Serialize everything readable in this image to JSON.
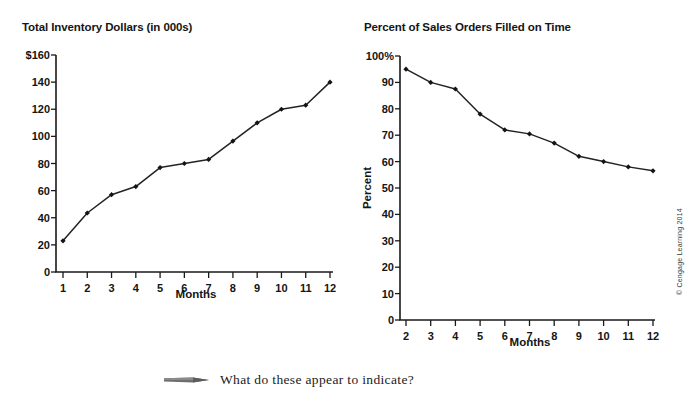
{
  "caption": {
    "icon": "pencil-icon",
    "text": "What do these appear to indicate?"
  },
  "credit": "© Cengage Learning 2014",
  "chart_data": [
    {
      "id": "inventory",
      "type": "line",
      "title": "Total Inventory Dollars (in 000s)",
      "xlabel": "Months",
      "ylabel": "",
      "x": [
        1,
        2,
        3,
        4,
        5,
        6,
        7,
        8,
        9,
        10,
        11,
        12
      ],
      "values": [
        23,
        43.5,
        57,
        63,
        77,
        80,
        83,
        96.5,
        110,
        120,
        123,
        140
      ],
      "categories": [
        "1",
        "2",
        "3",
        "4",
        "5",
        "6",
        "7",
        "8",
        "9",
        "10",
        "11",
        "12"
      ],
      "xtick_labels": [
        "1",
        "2",
        "3",
        "4",
        "5",
        "6",
        "7",
        "8",
        "9",
        "10",
        "11",
        "12"
      ],
      "ytick_values": [
        0,
        20,
        40,
        60,
        80,
        100,
        120,
        140,
        160
      ],
      "ytick_labels": [
        "0",
        "20",
        "40",
        "60",
        "80",
        "100",
        "120",
        "140",
        "$160"
      ],
      "xlim": [
        1,
        12
      ],
      "ylim": [
        0,
        160
      ],
      "grid": false,
      "legend": false,
      "marker": "diamond",
      "line_color": "#232323"
    },
    {
      "id": "on-time",
      "type": "line",
      "title": "Percent of Sales Orders Filled on Time",
      "xlabel": "Months",
      "ylabel": "Percent",
      "x": [
        2,
        3,
        4,
        5,
        6,
        7,
        8,
        9,
        10,
        11,
        12
      ],
      "values": [
        95,
        90,
        87.5,
        78,
        72,
        70.5,
        67,
        62,
        60,
        58,
        56.5
      ],
      "categories": [
        "2",
        "3",
        "4",
        "5",
        "6",
        "7",
        "8",
        "9",
        "10",
        "11",
        "12"
      ],
      "xtick_labels": [
        "2",
        "3",
        "4",
        "5",
        "6",
        "7",
        "8",
        "9",
        "10",
        "11",
        "12"
      ],
      "ytick_values": [
        0,
        10,
        20,
        30,
        40,
        50,
        60,
        70,
        80,
        90,
        100
      ],
      "ytick_labels": [
        "0",
        "10",
        "20",
        "30",
        "40",
        "50",
        "60",
        "70",
        "80",
        "90",
        "100%"
      ],
      "xlim": [
        2,
        12
      ],
      "ylim": [
        0,
        100
      ],
      "grid": false,
      "legend": false,
      "marker": "diamond",
      "line_color": "#232323"
    }
  ]
}
